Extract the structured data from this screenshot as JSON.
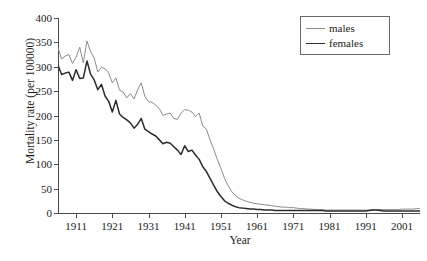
{
  "chart_data": {
    "type": "line",
    "title": "",
    "xlabel": "Year",
    "ylabel": "Mortality rate (per 100000)",
    "xlim": [
      1906,
      2006
    ],
    "ylim": [
      0,
      400
    ],
    "grid": false,
    "legend_position": "top-right",
    "x_ticks": [
      1911,
      1921,
      1931,
      1941,
      1951,
      1961,
      1971,
      1981,
      1991,
      2001
    ],
    "y_ticks": [
      0,
      50,
      100,
      150,
      200,
      250,
      300,
      350,
      400
    ],
    "colors": {
      "males": "#8c8c8c",
      "females": "#2b2b2b",
      "axis": "#4a4a4a",
      "legend_border": "#6b6b6b",
      "background": "#ffffff"
    },
    "x": [
      1906,
      1907,
      1908,
      1909,
      1910,
      1911,
      1912,
      1913,
      1914,
      1915,
      1916,
      1917,
      1918,
      1919,
      1920,
      1921,
      1922,
      1923,
      1924,
      1925,
      1926,
      1927,
      1928,
      1929,
      1930,
      1931,
      1932,
      1933,
      1934,
      1935,
      1936,
      1937,
      1938,
      1939,
      1940,
      1941,
      1942,
      1943,
      1944,
      1945,
      1946,
      1947,
      1948,
      1949,
      1950,
      1951,
      1952,
      1953,
      1954,
      1955,
      1956,
      1957,
      1958,
      1959,
      1960,
      1961,
      1962,
      1963,
      1964,
      1965,
      1966,
      1967,
      1968,
      1969,
      1970,
      1971,
      1972,
      1973,
      1974,
      1975,
      1976,
      1977,
      1978,
      1979,
      1980,
      1981,
      1982,
      1983,
      1984,
      1985,
      1986,
      1987,
      1988,
      1989,
      1990,
      1991,
      1992,
      1993,
      1994,
      1995,
      1996,
      1997,
      1998,
      1999,
      2000,
      2001,
      2002,
      2003,
      2004,
      2005,
      2006
    ],
    "series": [
      {
        "name": "males",
        "color": "#8c8c8c",
        "values": [
          339,
          316,
          322,
          325,
          307,
          320,
          340,
          308,
          353,
          331,
          318,
          289,
          299,
          296,
          287,
          267,
          277,
          252,
          248,
          236,
          245,
          234,
          253,
          267,
          239,
          228,
          227,
          221,
          214,
          200,
          203,
          205,
          194,
          192,
          205,
          212,
          211,
          207,
          198,
          205,
          178,
          172,
          150,
          131,
          110,
          92,
          71,
          56,
          44,
          36,
          30,
          27,
          24,
          22,
          20,
          19,
          18,
          17,
          16,
          15,
          14,
          13,
          12,
          12,
          11,
          11,
          10,
          9,
          9,
          8,
          8,
          7,
          7,
          7,
          6,
          6,
          6,
          6,
          6,
          6,
          6,
          6,
          6,
          6,
          6,
          6,
          6,
          7,
          7,
          7,
          7,
          7,
          7,
          7,
          7,
          8,
          8,
          8,
          8,
          9,
          9
        ]
      },
      {
        "name": "females",
        "color": "#2b2b2b",
        "values": [
          303,
          284,
          287,
          289,
          272,
          294,
          276,
          277,
          312,
          285,
          273,
          253,
          264,
          240,
          229,
          207,
          231,
          203,
          196,
          191,
          185,
          174,
          182,
          194,
          172,
          167,
          162,
          158,
          150,
          142,
          145,
          143,
          136,
          129,
          120,
          138,
          126,
          129,
          119,
          110,
          95,
          85,
          71,
          57,
          44,
          34,
          25,
          20,
          16,
          13,
          11,
          10,
          9,
          8,
          8,
          7,
          7,
          6,
          6,
          6,
          5,
          5,
          5,
          5,
          5,
          5,
          5,
          5,
          5,
          5,
          5,
          5,
          5,
          5,
          4,
          4,
          4,
          4,
          4,
          4,
          4,
          4,
          4,
          4,
          4,
          4,
          5,
          6,
          6,
          5,
          4,
          4,
          4,
          4,
          4,
          4,
          4,
          4,
          4,
          4,
          4
        ]
      }
    ],
    "legend": [
      {
        "label": "males",
        "color": "#8c8c8c",
        "line_width": 1
      },
      {
        "label": "females",
        "color": "#2b2b2b",
        "line_width": 1.6
      }
    ]
  }
}
